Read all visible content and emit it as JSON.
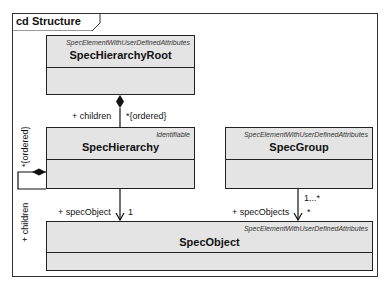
{
  "frame": {
    "title": "cd Structure"
  },
  "classes": {
    "root": {
      "stereotype": "SpecElementWithUserDefinedAttributes",
      "name": "SpecHierarchyRoot"
    },
    "hierarchy": {
      "stereotype": "Identifiable",
      "name": "SpecHierarchy"
    },
    "group": {
      "stereotype": "SpecElementWithUserDefinedAttributes",
      "name": "SpecGroup"
    },
    "object": {
      "stereotype": "SpecElementWithUserDefinedAttributes",
      "name": "SpecObject"
    }
  },
  "associations": {
    "root_children": {
      "role": "+ children",
      "multiplicity": "*{ordered}"
    },
    "self_children": {
      "role": "+ children",
      "multiplicity": "*{ordered}"
    },
    "hierarchy_object": {
      "role": "+ specObject",
      "multiplicity": "1"
    },
    "group_objects": {
      "role": "+ specObjects",
      "multiplicity": "*",
      "source_multiplicity": "1...*"
    }
  }
}
